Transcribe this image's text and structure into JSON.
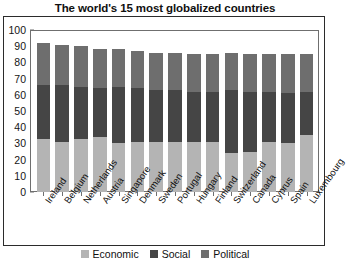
{
  "chart_data": {
    "type": "bar",
    "subtype": "stacked-bar",
    "title": "The world's 15 most globalized countries",
    "xlabel": "",
    "ylabel": "",
    "ylim": [
      0,
      100
    ],
    "yticks": [
      0,
      10,
      20,
      30,
      40,
      50,
      60,
      70,
      80,
      90,
      100
    ],
    "grid": false,
    "legend_position": "bottom",
    "categories": [
      "Ireland",
      "Belgium",
      "Netherlands",
      "Austria",
      "Singapore",
      "Denmark",
      "Sweden",
      "Portugal",
      "Hungary",
      "Finland",
      "Switzerland",
      "Canada",
      "Cyprus",
      "Spain",
      "Luxembourg"
    ],
    "series": [
      {
        "name": "Economic",
        "color": "#b4b4b4",
        "values": [
          33,
          31,
          33,
          34,
          30,
          31,
          31,
          31,
          31,
          31,
          24,
          25,
          31,
          30,
          35
        ]
      },
      {
        "name": "Social",
        "color": "#454545",
        "values": [
          33,
          35,
          32,
          30,
          35,
          33,
          32,
          32,
          31,
          31,
          39,
          37,
          31,
          31,
          27
        ]
      },
      {
        "name": "Political",
        "color": "#6e6e6e",
        "values": [
          26,
          25,
          25,
          24,
          23,
          23,
          23,
          23,
          23,
          23,
          23,
          23,
          23,
          24,
          23
        ]
      }
    ],
    "totals": [
      92,
      91,
      90,
      88,
      88,
      87,
      86,
      86,
      85,
      85,
      86,
      85,
      85,
      85,
      85
    ]
  },
  "legend": {
    "items": [
      {
        "label": "Economic",
        "color": "#b4b4b4"
      },
      {
        "label": "Social",
        "color": "#454545"
      },
      {
        "label": "Political",
        "color": "#6e6e6e"
      }
    ]
  }
}
